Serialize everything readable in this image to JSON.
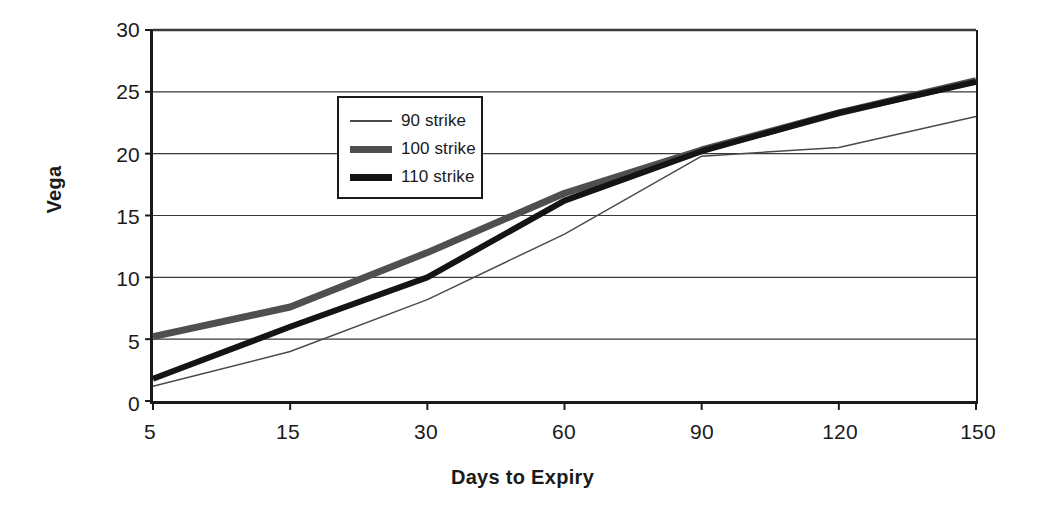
{
  "chart_data": {
    "type": "line",
    "title": "",
    "xlabel": "Days to Expiry",
    "ylabel": "Vega",
    "categories": [
      "5",
      "15",
      "30",
      "60",
      "90",
      "120",
      "150"
    ],
    "x_tick_labels": [
      "5",
      "15",
      "30",
      "60",
      "90",
      "120",
      "150"
    ],
    "y_tick_labels": [
      "0",
      "5",
      "10",
      "15",
      "20",
      "25",
      "30"
    ],
    "y_ticks": [
      0,
      5,
      10,
      15,
      20,
      25,
      30
    ],
    "ylim": [
      0,
      30
    ],
    "grid": "horizontal",
    "legend_position": "top-left-inside",
    "series": [
      {
        "name": "90 strike",
        "style": "thin",
        "color": "#4a4a4a",
        "width": 1.5,
        "values": [
          1.2,
          4.0,
          8.2,
          13.5,
          19.8,
          20.5,
          23.0
        ]
      },
      {
        "name": "100 strike",
        "style": "thick-gray",
        "color": "#4f4f4f",
        "width": 7,
        "values": [
          5.2,
          7.6,
          12.0,
          16.8,
          20.3,
          23.3,
          25.9
        ]
      },
      {
        "name": "110 strike",
        "style": "thick-black",
        "color": "#141414",
        "width": 6,
        "values": [
          1.8,
          6.0,
          10.0,
          16.2,
          20.2,
          23.3,
          25.8
        ]
      }
    ]
  },
  "legend": {
    "items": [
      {
        "label": "90 strike"
      },
      {
        "label": "100 strike"
      },
      {
        "label": "110 strike"
      }
    ]
  },
  "axes": {
    "y_title": "Vega",
    "x_title": "Days to Expiry"
  },
  "colors": {
    "axis": "#1a1a1a",
    "gridline": "#3a3a3a",
    "background": "#ffffff"
  }
}
